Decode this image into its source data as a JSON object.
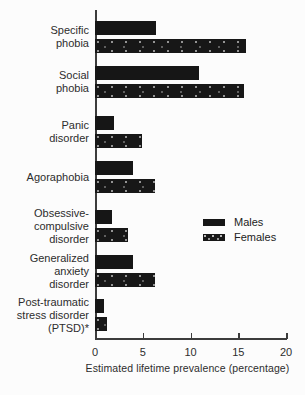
{
  "chart_data": {
    "type": "bar",
    "orientation": "horizontal",
    "categories": [
      "Specific phobia",
      "Social phobia",
      "Panic disorder",
      "Agoraphobia",
      "Obsessive-compulsive disorder",
      "Generalized anxiety disorder",
      "Post-traumatic stress disorder (PTSD)*"
    ],
    "category_lines": [
      [
        "Specific",
        "phobia"
      ],
      [
        "Social",
        "phobia"
      ],
      [
        "Panic",
        "disorder"
      ],
      [
        "Agoraphobia"
      ],
      [
        "Obsessive-",
        "compulsive",
        "disorder"
      ],
      [
        "Generalized",
        "anxiety",
        "disorder"
      ],
      [
        "Post-traumatic",
        "stress disorder",
        "(PTSD)*"
      ]
    ],
    "series": [
      {
        "name": "Males",
        "pattern": "solid",
        "color": "#161616",
        "values": [
          6.4,
          10.9,
          2.0,
          4.0,
          1.8,
          4.0,
          0.9
        ]
      },
      {
        "name": "Females",
        "pattern": "speckled",
        "color": "#171717",
        "values": [
          15.8,
          15.6,
          4.9,
          6.3,
          3.5,
          6.3,
          1.3
        ]
      }
    ],
    "xlabel": "Estimated lifetime prevalence (percentage)",
    "xlim": [
      0,
      20
    ],
    "xticks": [
      0,
      5,
      10,
      15,
      20
    ],
    "grid": false,
    "legend_position": "center-right",
    "background": "#fcfcfc"
  }
}
